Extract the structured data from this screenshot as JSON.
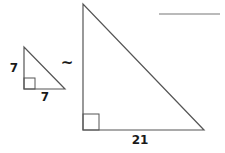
{
  "diagram": {
    "type": "similar-right-triangles",
    "colors": {
      "stroke": "#555555",
      "text": "#1a1a1a",
      "background": "#ffffff"
    },
    "small_triangle": {
      "vertical_leg_label": "7",
      "horizontal_leg_label": "7",
      "right_angle": "bottom-left"
    },
    "similarity_symbol": "~",
    "large_triangle": {
      "vertical_leg_label": "",
      "horizontal_leg_label": "21",
      "right_angle": "bottom-left"
    },
    "answer_blank": ""
  }
}
